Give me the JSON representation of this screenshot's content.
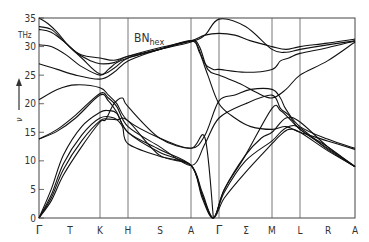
{
  "chart_data": {
    "type": "line",
    "title": "BN",
    "title_subscript": "hex",
    "ylabel": "ν",
    "yunit": "THz",
    "ylim": [
      0,
      35
    ],
    "yticks": [
      0,
      5,
      10,
      15,
      20,
      25,
      30,
      35
    ],
    "grid": false,
    "legend": null,
    "x_labels": [
      "Γ",
      "T",
      "K",
      "H",
      "S",
      "A",
      "Γ",
      "Σ",
      "M",
      "L",
      "R",
      "A"
    ],
    "high_symmetry_points": [
      "Γ",
      "K",
      "H",
      "A",
      "Γ",
      "M",
      "L",
      "A"
    ],
    "segments": [
      {
        "from": "Γ",
        "to": "K",
        "label": "T"
      },
      {
        "from": "K",
        "to": "H",
        "label": ""
      },
      {
        "from": "H",
        "to": "A",
        "label": "S"
      },
      {
        "from": "A",
        "to": "Γ",
        "label": ""
      },
      {
        "from": "Γ",
        "to": "M",
        "label": "Σ"
      },
      {
        "from": "M",
        "to": "L",
        "label": ""
      },
      {
        "from": "L",
        "to": "A",
        "label": "R"
      }
    ],
    "series": [
      {
        "name": "branch-1",
        "points": [
          [
            0,
            35
          ],
          [
            0.15,
            34
          ],
          [
            0.3,
            32.5
          ],
          [
            0.5,
            30
          ],
          [
            0.7,
            28.5
          ],
          [
            1,
            28
          ],
          [
            1.5,
            27.6
          ],
          [
            2,
            28.3
          ],
          [
            2.5,
            29.5
          ],
          [
            3,
            30.8
          ],
          [
            3.5,
            32
          ],
          [
            4,
            34.8
          ],
          [
            4.5,
            33.5
          ],
          [
            5,
            29.5
          ],
          [
            5.5,
            29
          ],
          [
            6,
            29.5
          ],
          [
            6.5,
            30.3
          ],
          [
            7,
            31
          ]
        ]
      },
      {
        "name": "branch-2",
        "points": [
          [
            0,
            33.5
          ],
          [
            0.2,
            33
          ],
          [
            0.4,
            31
          ],
          [
            0.6,
            29
          ],
          [
            0.85,
            27.5
          ],
          [
            1,
            27
          ],
          [
            1.5,
            27.2
          ],
          [
            2,
            28.3
          ],
          [
            2.5,
            29.8
          ],
          [
            3,
            31
          ],
          [
            3.5,
            32
          ],
          [
            4,
            32.3
          ],
          [
            4.3,
            32
          ],
          [
            4.6,
            31
          ],
          [
            5,
            30
          ],
          [
            5.5,
            29.5
          ],
          [
            6,
            30
          ],
          [
            6.5,
            30.6
          ],
          [
            7,
            31.3
          ]
        ]
      },
      {
        "name": "branch-3",
        "points": [
          [
            0,
            33
          ],
          [
            0.2,
            32.5
          ],
          [
            0.45,
            30.5
          ],
          [
            0.7,
            28
          ],
          [
            1,
            25.2
          ],
          [
            1.5,
            26.2
          ],
          [
            2,
            28
          ],
          [
            2.5,
            29.5
          ],
          [
            3,
            31
          ],
          [
            3.2,
            30.5
          ],
          [
            3.5,
            27
          ],
          [
            3.8,
            26
          ],
          [
            4,
            26
          ],
          [
            4.5,
            25.5
          ],
          [
            5,
            26
          ],
          [
            5.3,
            27.5
          ],
          [
            5.6,
            28
          ],
          [
            6,
            28.8
          ],
          [
            6.5,
            29.8
          ],
          [
            7,
            31
          ]
        ]
      },
      {
        "name": "branch-4",
        "points": [
          [
            0,
            30.3
          ],
          [
            0.2,
            30
          ],
          [
            0.45,
            28.5
          ],
          [
            0.7,
            26.5
          ],
          [
            1,
            25
          ],
          [
            1.3,
            26
          ],
          [
            1.6,
            27.2
          ],
          [
            2,
            28
          ],
          [
            2.5,
            29.5
          ],
          [
            3,
            31
          ],
          [
            3.3,
            30
          ],
          [
            3.6,
            26
          ],
          [
            4,
            25
          ],
          [
            4.4,
            23.5
          ],
          [
            4.7,
            22
          ],
          [
            5,
            21
          ],
          [
            5.5,
            22.5
          ],
          [
            6,
            25
          ],
          [
            6.5,
            27.5
          ],
          [
            7,
            30.8
          ]
        ]
      },
      {
        "name": "branch-5",
        "points": [
          [
            0,
            27
          ],
          [
            0.3,
            26
          ],
          [
            0.6,
            25
          ],
          [
            1,
            24.3
          ],
          [
            1.5,
            25.5
          ],
          [
            2,
            27.5
          ],
          [
            2.5,
            29.5
          ],
          [
            3,
            31
          ],
          [
            3.3,
            29
          ],
          [
            3.6,
            25
          ],
          [
            4,
            20
          ],
          [
            4.3,
            17.5
          ],
          [
            4.6,
            16
          ],
          [
            5,
            15.5
          ],
          [
            5.5,
            16
          ],
          [
            6,
            15
          ],
          [
            6.5,
            13.5
          ],
          [
            7,
            12
          ]
        ]
      },
      {
        "name": "branch-6",
        "points": [
          [
            0,
            20.7
          ],
          [
            0.3,
            22.5
          ],
          [
            0.6,
            23.3
          ],
          [
            1,
            22.8
          ],
          [
            1.3,
            21.5
          ],
          [
            1.6,
            20
          ],
          [
            2,
            17
          ],
          [
            2.5,
            14
          ],
          [
            3,
            12.2
          ],
          [
            3.5,
            14.5
          ],
          [
            4,
            20.5
          ],
          [
            4.3,
            21.5
          ],
          [
            4.6,
            22.5
          ],
          [
            5,
            22.5
          ],
          [
            5.3,
            21
          ],
          [
            5.5,
            19
          ],
          [
            6,
            16
          ],
          [
            6.5,
            13.8
          ],
          [
            7,
            12.2
          ]
        ]
      },
      {
        "name": "branch-7",
        "points": [
          [
            0,
            13.8
          ],
          [
            0.3,
            15.5
          ],
          [
            0.6,
            18
          ],
          [
            1,
            21.8
          ],
          [
            1.3,
            21
          ],
          [
            1.6,
            19.5
          ],
          [
            2,
            16
          ],
          [
            2.5,
            12.5
          ],
          [
            3,
            9.2
          ],
          [
            3.5,
            13
          ],
          [
            4,
            17.5
          ],
          [
            4.5,
            20
          ],
          [
            5,
            21.5
          ],
          [
            5.3,
            19.2
          ],
          [
            5.6,
            18
          ],
          [
            6,
            15.5
          ],
          [
            6.5,
            12.5
          ],
          [
            7,
            9
          ]
        ]
      },
      {
        "name": "branch-8",
        "points": [
          [
            0,
            13.8
          ],
          [
            0.3,
            15.2
          ],
          [
            0.6,
            17.5
          ],
          [
            1,
            21.5
          ],
          [
            1.3,
            20.5
          ],
          [
            1.6,
            18.5
          ],
          [
            2,
            15
          ],
          [
            2.5,
            12
          ],
          [
            3,
            9.2
          ],
          [
            3.4,
            4
          ],
          [
            3.8,
            0
          ],
          [
            4.1,
            5
          ],
          [
            4.5,
            11
          ],
          [
            5,
            19.2
          ],
          [
            5.3,
            18.8
          ],
          [
            5.6,
            17.5
          ],
          [
            6,
            15.5
          ],
          [
            6.5,
            12.2
          ],
          [
            7,
            9
          ]
        ]
      },
      {
        "name": "branch-9",
        "points": [
          [
            0,
            0
          ],
          [
            0.2,
            5
          ],
          [
            0.4,
            11
          ],
          [
            0.7,
            16
          ],
          [
            1,
            18.5
          ],
          [
            1.3,
            18.8
          ],
          [
            1.6,
            18.3
          ],
          [
            2,
            15
          ],
          [
            2.5,
            11.5
          ],
          [
            3,
            9.2
          ],
          [
            3.4,
            4.5
          ],
          [
            3.8,
            0
          ],
          [
            4.1,
            5
          ],
          [
            4.5,
            11
          ],
          [
            4.8,
            14
          ],
          [
            5,
            15
          ],
          [
            5.5,
            17.5
          ],
          [
            6,
            16.8
          ],
          [
            6.5,
            12.5
          ],
          [
            7,
            9
          ]
        ]
      },
      {
        "name": "branch-10",
        "points": [
          [
            0,
            0
          ],
          [
            0.2,
            4
          ],
          [
            0.4,
            9.5
          ],
          [
            0.7,
            14.5
          ],
          [
            1,
            17.5
          ],
          [
            1.5,
            17.5
          ],
          [
            1.8,
            16
          ],
          [
            2,
            13
          ],
          [
            2.5,
            10.8
          ],
          [
            3,
            9.2
          ],
          [
            3.4,
            3.5
          ],
          [
            3.8,
            0
          ],
          [
            4.1,
            4.5
          ],
          [
            4.5,
            10
          ],
          [
            5,
            13.5
          ],
          [
            5.3,
            15
          ],
          [
            5.6,
            16
          ],
          [
            6,
            15.8
          ],
          [
            6.5,
            12
          ],
          [
            7,
            9
          ]
        ]
      },
      {
        "name": "branch-11",
        "points": [
          [
            0,
            0
          ],
          [
            0.2,
            3.5
          ],
          [
            0.4,
            8.5
          ],
          [
            0.7,
            13.5
          ],
          [
            1,
            17
          ],
          [
            1.3,
            17.3
          ],
          [
            1.6,
            17.2
          ],
          [
            2,
            17
          ],
          [
            2.5,
            11
          ],
          [
            3,
            9.2
          ],
          [
            3.4,
            4
          ],
          [
            3.8,
            0
          ],
          [
            4.1,
            3.5
          ],
          [
            4.5,
            8
          ],
          [
            5,
            13
          ],
          [
            5.3,
            14.5
          ],
          [
            5.6,
            15.5
          ],
          [
            6,
            15
          ],
          [
            6.5,
            11.8
          ],
          [
            7,
            9
          ]
        ]
      },
      {
        "name": "branch-12",
        "points": [
          [
            0,
            0
          ],
          [
            0.2,
            3
          ],
          [
            0.4,
            7.5
          ],
          [
            0.7,
            12.5
          ],
          [
            1,
            16.8
          ],
          [
            1.2,
            17.2
          ],
          [
            1.5,
            20
          ],
          [
            1.8,
            21
          ],
          [
            2,
            19.5
          ],
          [
            2.5,
            14
          ],
          [
            3,
            12.2
          ],
          [
            3.5,
            14
          ],
          [
            3.8,
            0
          ]
        ]
      }
    ]
  },
  "axis": {
    "y_tick_labels": [
      "0",
      "5",
      "10",
      "15",
      "20",
      "25",
      "30",
      "35"
    ],
    "y_unit": "THz",
    "y_symbol": "ν"
  },
  "annotation": {
    "compound": "BN",
    "subscript": "hex"
  }
}
